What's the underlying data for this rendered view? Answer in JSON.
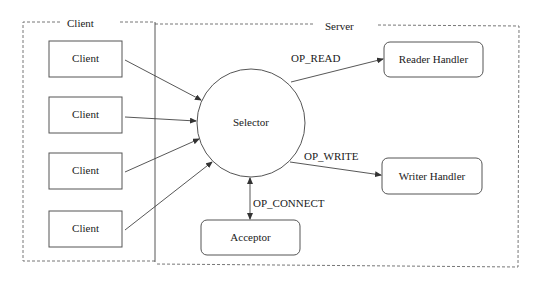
{
  "diagram": {
    "regions": {
      "client": {
        "label": "Client"
      },
      "server": {
        "label": "Server"
      }
    },
    "clients": [
      {
        "label": "Client"
      },
      {
        "label": "Client"
      },
      {
        "label": "Client"
      },
      {
        "label": "Client"
      }
    ],
    "selector": {
      "label": "Selector"
    },
    "handlers": {
      "reader": {
        "label": "Reader Handler"
      },
      "writer": {
        "label": "Writer Handler"
      },
      "acceptor": {
        "label": "Acceptor"
      }
    },
    "edges": {
      "op_read": {
        "label": "OP_READ"
      },
      "op_write": {
        "label": "OP_WRITE"
      },
      "op_connect": {
        "label": "OP_CONNECT"
      }
    },
    "colors": {
      "stroke": "#555555",
      "text": "#1a1a1a",
      "background": "#ffffff"
    }
  }
}
